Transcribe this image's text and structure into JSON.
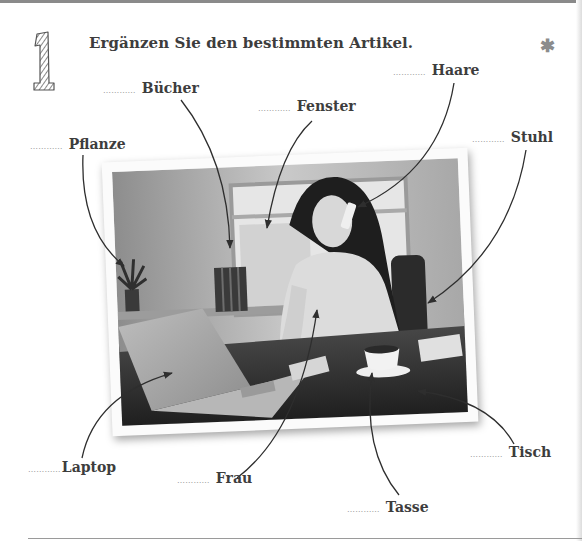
{
  "exercise": {
    "number": "1",
    "instruction": "Ergänzen Sie den bestimmten Artikel.",
    "difficulty_icon": "asterisk-icon",
    "difficulty_symbol": "✱"
  },
  "blank": "…………",
  "labels": [
    {
      "id": "buecher",
      "word": "Bücher"
    },
    {
      "id": "fenster",
      "word": "Fenster"
    },
    {
      "id": "haare",
      "word": "Haare"
    },
    {
      "id": "pflanze",
      "word": "Pflanze"
    },
    {
      "id": "stuhl",
      "word": "Stuhl"
    },
    {
      "id": "laptop",
      "word": "Laptop"
    },
    {
      "id": "frau",
      "word": "Frau"
    },
    {
      "id": "tisch",
      "word": "Tisch"
    },
    {
      "id": "tasse",
      "word": "Tasse"
    }
  ],
  "photo": {
    "description": "Woman talking on a mobile phone while working on a laptop at a desk with a coffee cup, books, a plant, a window and a chair"
  },
  "colors": {
    "text": "#3d3d3d",
    "dots": "#9a9a9a",
    "rule": "#8a8a8a"
  }
}
